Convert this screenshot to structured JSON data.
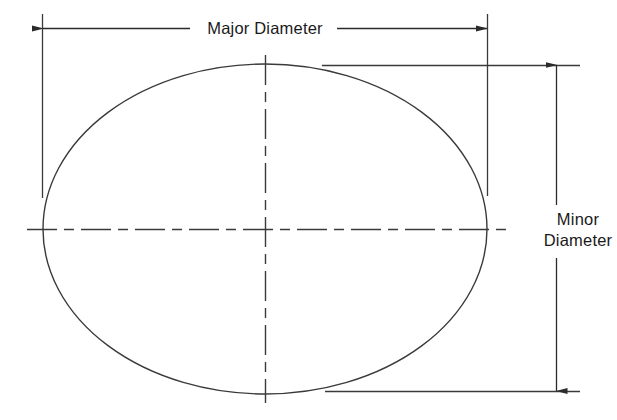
{
  "diagram": {
    "background_color": "#ffffff",
    "line_color": "#333333",
    "text_color": "#1a1a1a",
    "labels": {
      "major_diameter": "Major Diameter",
      "minor_line_1": "Minor",
      "minor_line_2": "Diameter"
    },
    "geometry": {
      "ellipse_center_x": 265,
      "ellipse_center_y": 229,
      "ellipse_radius_x": 222,
      "ellipse_radius_y": 165,
      "major_dimension_line_y": 28,
      "major_dimension_x_start": 43,
      "major_dimension_x_end": 487,
      "minor_dimension_line_x": 556,
      "minor_dimension_y_start": 65,
      "minor_dimension_y_end": 391,
      "text_gap_major_left": 190,
      "text_gap_major_right": 337,
      "text_gap_minor_top": 205,
      "text_gap_minor_bottom": 258
    },
    "annotations": [
      {
        "name": "major-diameter",
        "label": "Major Diameter",
        "orientation": "horizontal",
        "arrows": "both-ends"
      },
      {
        "name": "minor-diameter",
        "label": "Minor Diameter",
        "orientation": "vertical",
        "arrows": "both-ends"
      }
    ]
  }
}
